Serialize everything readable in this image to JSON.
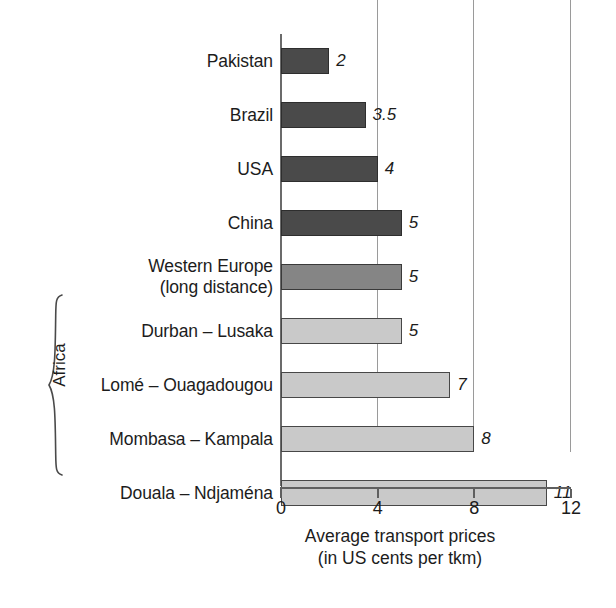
{
  "chart_data": {
    "type": "bar",
    "orientation": "horizontal",
    "title": "",
    "subtitle": "",
    "xlabel": "Average transport prices",
    "xlabel_line2": "(in US cents per tkm)",
    "ylabel": "",
    "xlim": [
      0,
      12
    ],
    "xticks": [
      "0",
      "4",
      "8",
      "12"
    ],
    "xtick_values": [
      0,
      4,
      8,
      12
    ],
    "grid": "vertical gridlines at 4, 8, 12",
    "legend": "none",
    "categories": [
      "Pakistan",
      "Brazil",
      "USA",
      "China",
      "Western Europe (long distance)",
      "Durban – Lusaka",
      "Lomé – Ouagadougou",
      "Mombasa – Kampala",
      "Douala – Ndjaména"
    ],
    "values": [
      2,
      3.5,
      4,
      5,
      5,
      5,
      7,
      8,
      11
    ],
    "value_labels": [
      "2",
      "3.5",
      "4",
      "5",
      "5",
      "5",
      "7",
      "8",
      "11"
    ],
    "group_annotation": "Africa",
    "group_annotation_rows": [
      5,
      6,
      7,
      8
    ],
    "series_colors": {
      "dark_gray": "#4a4a4a",
      "medium_gray": "#858585",
      "light_gray": "#c9c9c9"
    }
  },
  "rows": [
    {
      "label_lines": [
        "Pakistan"
      ],
      "value": 2,
      "value_label": "2",
      "shade": "dark"
    },
    {
      "label_lines": [
        "Brazil"
      ],
      "value": 3.5,
      "value_label": "3.5",
      "shade": "dark"
    },
    {
      "label_lines": [
        "USA"
      ],
      "value": 4,
      "value_label": "4",
      "shade": "dark"
    },
    {
      "label_lines": [
        "China"
      ],
      "value": 5,
      "value_label": "5",
      "shade": "dark"
    },
    {
      "label_lines": [
        "Western Europe",
        "(long distance)"
      ],
      "value": 5,
      "value_label": "5",
      "shade": "medium"
    },
    {
      "label_lines": [
        "Durban – Lusaka"
      ],
      "value": 5,
      "value_label": "5",
      "shade": "light"
    },
    {
      "label_lines": [
        "Lomé – Ouagadougou"
      ],
      "value": 7,
      "value_label": "7",
      "shade": "light"
    },
    {
      "label_lines": [
        "Mombasa – Kampala"
      ],
      "value": 8,
      "value_label": "8",
      "shade": "light"
    },
    {
      "label_lines": [
        "Douala – Ndjaména"
      ],
      "value": 11,
      "value_label": "11",
      "shade": "light"
    }
  ],
  "axis": {
    "ticks": [
      {
        "label": "0",
        "value": 0
      },
      {
        "label": "4",
        "value": 4
      },
      {
        "label": "8",
        "value": 8
      },
      {
        "label": "12",
        "value": 12
      }
    ],
    "title_line1": "Average transport prices",
    "title_line2": "(in US cents per tkm)"
  },
  "group": {
    "label": "Africa"
  }
}
